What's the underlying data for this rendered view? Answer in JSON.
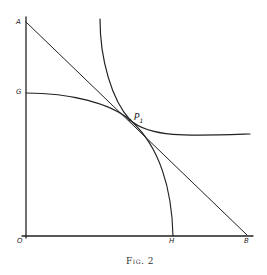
{
  "figure": {
    "caption": "Fig. 2",
    "labels": {
      "A": "A",
      "G": "G",
      "P1": "P",
      "P1_sub": "1",
      "O": "O",
      "H": "H",
      "B": "B"
    },
    "elements": [
      {
        "name": "y-axis",
        "from": "O",
        "to": "top"
      },
      {
        "name": "x-axis",
        "from": "O",
        "to": "right"
      },
      {
        "name": "straight-line-AB",
        "from": "A",
        "to": "B",
        "tangent_at": "P1"
      },
      {
        "name": "concave-curve-GH",
        "from": "G",
        "to": "H",
        "through": "P1"
      },
      {
        "name": "convex-curve",
        "from": "top",
        "to": "right",
        "through": "P1"
      }
    ],
    "colors": {
      "ink": "#222222",
      "background": "#ffffff"
    }
  }
}
